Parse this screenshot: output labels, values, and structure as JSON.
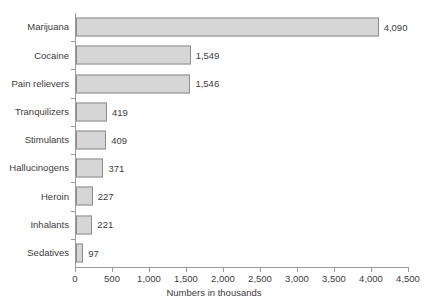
{
  "chart_data": {
    "type": "bar",
    "orientation": "horizontal",
    "title": "",
    "title_remnant": "",
    "xlabel": "Numbers in thousands",
    "ylabel": "",
    "xlim": [
      0,
      4500
    ],
    "xticks": [
      0,
      500,
      1000,
      1500,
      2000,
      2500,
      3000,
      3500,
      4000,
      4500
    ],
    "xtick_labels": [
      "0",
      "500",
      "1,000",
      "1,500",
      "2,000",
      "2,500",
      "3,000",
      "3,500",
      "4,000",
      "4,500"
    ],
    "grid": false,
    "legend": null,
    "categories": [
      "Marijuana",
      "Cocaine",
      "Pain relievers",
      "Tranquilizers",
      "Stimulants",
      "Hallucinogens",
      "Heroin",
      "Inhalants",
      "Sedatives"
    ],
    "values": [
      4090,
      1549,
      1546,
      419,
      409,
      371,
      227,
      221,
      97
    ],
    "value_labels": [
      "4,090",
      "1,549",
      "1,546",
      "419",
      "409",
      "371",
      "227",
      "221",
      "97"
    ],
    "colors": {
      "bar_fill": "#d6d6d6",
      "bar_border": "#8c8c8c",
      "axis": "#9a9a9a",
      "text": "#3c3c3c",
      "background": "#ffffff"
    }
  }
}
